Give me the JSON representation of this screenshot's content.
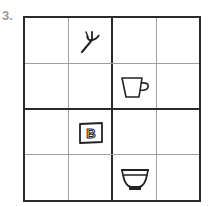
{
  "puzzle": {
    "number_label": "3.",
    "rows": 4,
    "cols": 4,
    "block_size": 2,
    "colors": {
      "thick_line": "#2b2b2b",
      "thin_line": "#9e9e9e",
      "number": "#9a9a9a"
    },
    "cells": [
      {
        "row": 0,
        "col": 1,
        "icon": "fork-icon"
      },
      {
        "row": 1,
        "col": 2,
        "icon": "cup-icon"
      },
      {
        "row": 2,
        "col": 1,
        "icon": "b-box-icon",
        "text": "B"
      },
      {
        "row": 3,
        "col": 2,
        "icon": "bowl-icon"
      }
    ]
  }
}
